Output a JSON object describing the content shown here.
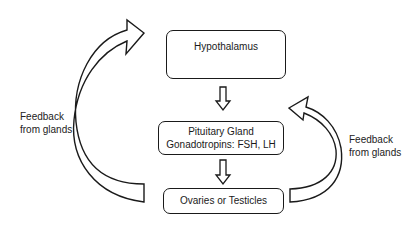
{
  "diagram": {
    "nodes": [
      {
        "id": "hypothalamus",
        "lines": [
          "Hypothalamus"
        ]
      },
      {
        "id": "pituitary",
        "lines": [
          "Pituitary Gland",
          "Gonadotropins: FSH, LH"
        ]
      },
      {
        "id": "gonads",
        "lines": [
          "Ovaries or Testicles"
        ]
      }
    ],
    "edges": [
      {
        "from": "hypothalamus",
        "to": "pituitary",
        "type": "down-arrow"
      },
      {
        "from": "pituitary",
        "to": "gonads",
        "type": "down-arrow"
      },
      {
        "from": "gonads",
        "to": "hypothalamus",
        "type": "curved-feedback-arrow",
        "label": "Feedback from glands"
      },
      {
        "from": "gonads",
        "to": "pituitary",
        "type": "curved-feedback-arrow",
        "label": "Feedback from glands"
      }
    ],
    "labels": {
      "left": [
        "Feedback",
        "from glands"
      ],
      "right": [
        "Feedback",
        "from glands"
      ]
    },
    "colors": {
      "stroke": "#1a1a1a",
      "fill": "#ffffff"
    }
  }
}
